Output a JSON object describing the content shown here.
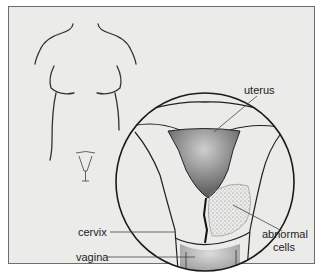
{
  "figure": {
    "colors": {
      "background": "#ebebea",
      "frame": "#6d6d6d",
      "line": "#222222"
    },
    "labels": {
      "uterus": "uterus",
      "cervix": "cervix",
      "vagina": "vagina",
      "abnormal_cells_line1": "abnormal",
      "abnormal_cells_line2": "cells"
    }
  }
}
